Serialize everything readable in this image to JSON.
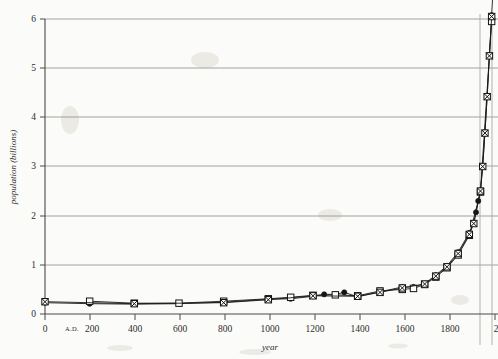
{
  "figure": {
    "name": "world-population-growth",
    "background_color": "#fbfbf9",
    "ink_color": "#1a1a1a",
    "grid_color": "#8d8d8d"
  },
  "axes": {
    "x_title": "year",
    "y_title": "population (billions)",
    "era_marker": "A.D.",
    "x_tick_labels": [
      "0",
      "200",
      "400",
      "600",
      "800",
      "1000",
      "1200",
      "1400",
      "1600",
      "1800",
      "2"
    ],
    "y_tick_labels": [
      "0",
      "1",
      "2",
      "3",
      "4",
      "5",
      "6"
    ]
  },
  "chart_data": {
    "type": "line",
    "title": "",
    "xlabel": "year",
    "ylabel": "population (billions)",
    "xlim": [
      0,
      2015
    ],
    "ylim": [
      0,
      6
    ],
    "xticks": [
      0,
      200,
      400,
      600,
      800,
      1000,
      1200,
      1400,
      1600,
      1800,
      2000
    ],
    "yticks": [
      0,
      1,
      2,
      3,
      4,
      5,
      6
    ],
    "grid": "horizontal gridlines at every integer y value; one vertical gridline near year 1930",
    "legend": "none",
    "annotations": [
      "A.D. printed before the 200 tick label"
    ],
    "series": [
      {
        "name": "estimate-filled-circle",
        "marker": "filled-circle",
        "x": [
          0,
          200,
          400,
          600,
          800,
          1000,
          1100,
          1200,
          1250,
          1300,
          1340,
          1400,
          1500,
          1600,
          1650,
          1700,
          1750,
          1800,
          1850,
          1900,
          1920,
          1930,
          1940,
          1950,
          1960,
          1970,
          1980,
          1990,
          2000,
          2010
        ],
        "y": [
          0.23,
          0.21,
          0.2,
          0.21,
          0.24,
          0.3,
          0.31,
          0.36,
          0.4,
          0.4,
          0.44,
          0.35,
          0.45,
          0.55,
          0.55,
          0.62,
          0.79,
          0.98,
          1.26,
          1.65,
          1.86,
          2.07,
          2.3,
          2.52,
          3.02,
          3.7,
          4.44,
          5.27,
          6.08,
          6.9
        ]
      },
      {
        "name": "estimate-open-square",
        "marker": "open-square",
        "x": [
          200,
          400,
          600,
          800,
          1000,
          1100,
          1200,
          1300,
          1400,
          1500,
          1600,
          1650,
          1700,
          1750,
          1800,
          1850,
          1900,
          1950,
          2000
        ],
        "y": [
          0.26,
          0.22,
          0.22,
          0.26,
          0.31,
          0.34,
          0.38,
          0.39,
          0.37,
          0.47,
          0.5,
          0.52,
          0.6,
          0.75,
          0.94,
          1.2,
          1.6,
          2.48,
          5.95
        ]
      },
      {
        "name": "estimate-crossed-square",
        "marker": "crossed-square",
        "x": [
          0,
          400,
          800,
          1000,
          1200,
          1400,
          1500,
          1600,
          1700,
          1750,
          1800,
          1850,
          1900,
          1920,
          1950,
          1960,
          1970,
          1980,
          1990,
          2000
        ],
        "y": [
          0.25,
          0.21,
          0.23,
          0.29,
          0.37,
          0.36,
          0.44,
          0.53,
          0.61,
          0.77,
          0.96,
          1.23,
          1.62,
          1.84,
          2.5,
          3.0,
          3.68,
          4.42,
          5.25,
          6.05
        ]
      }
    ]
  }
}
